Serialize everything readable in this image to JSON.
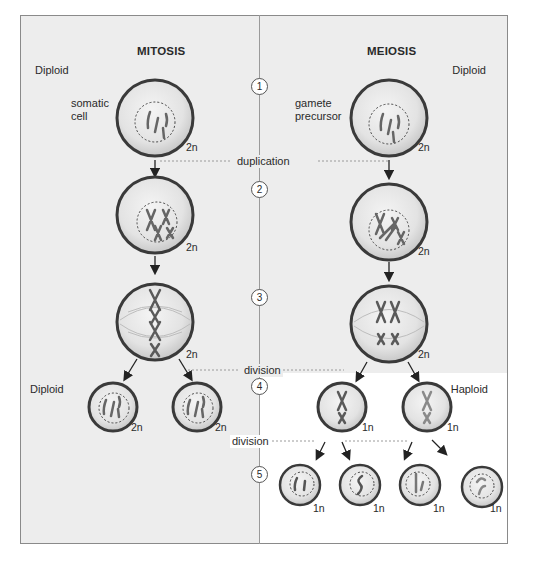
{
  "figure": {
    "type": "mitosis-vs-meiosis comparison diagram",
    "colors": {
      "panel_bg": "#ededed",
      "haploid_bg": "#ffffff",
      "cell_border": "#3a3a3a",
      "cell_fill": "#e2e2e2",
      "chromosome_dark": "#5a5a5a",
      "chromosome_light": "#9a9a9a",
      "guide_line": "#9a9a9a"
    }
  },
  "columns": {
    "left": {
      "title": "MITOSIS",
      "start_label": "Diploid",
      "cell_label_line1": "somatic",
      "cell_label_line2": "cell",
      "end_label": "Diploid"
    },
    "right": {
      "title": "MEIOSIS",
      "start_label": "Diploid",
      "cell_label_line1": "gamete",
      "cell_label_line2": "precursor",
      "end_label": "Haploid"
    }
  },
  "steps": [
    "1",
    "2",
    "3",
    "4",
    "5"
  ],
  "events": {
    "duplication": "duplication",
    "division1": "division",
    "division2": "division"
  },
  "ploidy": {
    "mitosis": [
      "2n",
      "2n",
      "2n",
      "2n",
      "2n"
    ],
    "meiosis": [
      "2n",
      "2n",
      "2n",
      "1n",
      "1n",
      "1n",
      "1n",
      "1n",
      "1n"
    ]
  }
}
